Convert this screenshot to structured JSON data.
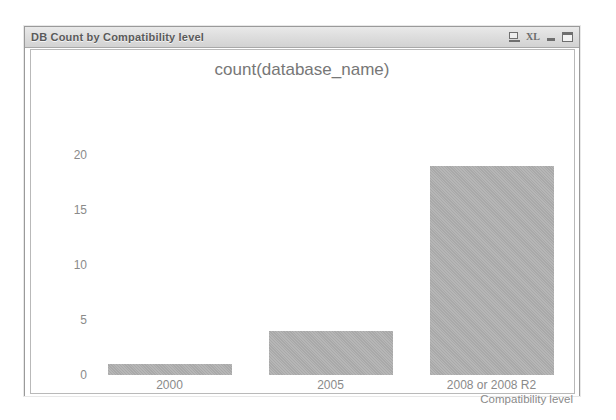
{
  "window": {
    "title": "DB Count by Compatibility level",
    "controls": [
      {
        "name": "screen-icon",
        "label": ""
      },
      {
        "name": "xl-icon",
        "label": "XL"
      },
      {
        "name": "minimize-button",
        "label": ""
      },
      {
        "name": "maximize-button",
        "label": ""
      }
    ]
  },
  "chart_data": {
    "type": "bar",
    "title": "count(database_name)",
    "categories": [
      "2000",
      "2005",
      "2008 or 2008 R2"
    ],
    "values": [
      1,
      4,
      19
    ],
    "xlabel": "Compatibility level",
    "ylabel": "",
    "ylim": [
      0,
      20
    ],
    "yticks": [
      0,
      5,
      10,
      15,
      20
    ],
    "grid": false,
    "legend": false,
    "bar_color": "#b0b0b0",
    "axis_text_color": "#8a8a8a",
    "title_color": "#777777"
  }
}
